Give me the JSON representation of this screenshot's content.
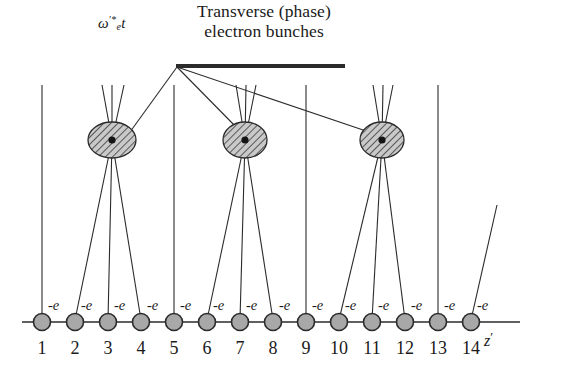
{
  "figure": {
    "width": 562,
    "height": 384,
    "background": "#ffffff",
    "line_color": "#2b2b2b",
    "text_color": "#1a1a1a",
    "bunch_fill": "#c9c9c9",
    "electron_fill": "#a8a8a8",
    "electron_stroke": "#2b2b2b"
  },
  "caption": {
    "line1": "Transverse (phase)",
    "line2": "electron bunches",
    "underline_x1": 176,
    "underline_x2": 345,
    "underline_y": 66,
    "underline_thickness": 4
  },
  "omega": {
    "symbol": "ω",
    "subscript": "e",
    "superscript": "′*",
    "variable": "t",
    "full": "ω'*_e t"
  },
  "axis": {
    "label": "z",
    "prime": "′",
    "y": 322,
    "x_start": 22,
    "x_end": 520
  },
  "electrons": {
    "charge_label": "-e",
    "count": 14,
    "radius": 8.5,
    "x_positions": [
      42,
      75,
      108,
      141,
      174,
      207,
      240,
      273,
      306,
      339,
      372,
      405,
      438,
      471
    ],
    "indices": [
      "1",
      "2",
      "3",
      "4",
      "5",
      "6",
      "7",
      "8",
      "9",
      "10",
      "11",
      "12",
      "13",
      "14"
    ]
  },
  "bunches": [
    {
      "id": "bunch-1",
      "cx": 112,
      "cy": 140,
      "rx": 24,
      "ry": 18,
      "source_electrons": [
        2,
        3,
        4
      ]
    },
    {
      "id": "bunch-2",
      "cx": 245,
      "cy": 140,
      "rx": 22,
      "ry": 18,
      "source_electrons": [
        6,
        7,
        8
      ]
    },
    {
      "id": "bunch-3",
      "cx": 382,
      "cy": 140,
      "rx": 22,
      "ry": 18,
      "source_electrons": [
        10,
        11,
        12
      ]
    }
  ],
  "straight_tracks": [
    {
      "id": "track-1",
      "electron": 1,
      "top_y": 85
    },
    {
      "id": "track-5",
      "electron": 5,
      "top_y": 85
    },
    {
      "id": "track-9",
      "electron": 9,
      "top_y": 85
    },
    {
      "id": "track-13",
      "electron": 13,
      "top_y": 85
    }
  ],
  "slanted_track": {
    "id": "track-14",
    "electron": 14,
    "top_x": 497,
    "top_y": 205
  },
  "upper_fans": [
    {
      "bunch": 1,
      "top_y": 85,
      "spread": [
        -10,
        0,
        12
      ]
    },
    {
      "bunch": 2,
      "top_y": 85,
      "spread": [
        -9,
        1,
        11
      ]
    },
    {
      "bunch": 3,
      "top_y": 85,
      "spread": [
        -9,
        1,
        11
      ]
    }
  ],
  "leader_lines": {
    "origin_x": 177,
    "origin_y": 67,
    "targets": [
      {
        "bunch": 1,
        "x": 130,
        "y": 132
      },
      {
        "bunch": 2,
        "x": 240,
        "y": 131
      },
      {
        "bunch": 3,
        "x": 372,
        "y": 133
      }
    ]
  }
}
